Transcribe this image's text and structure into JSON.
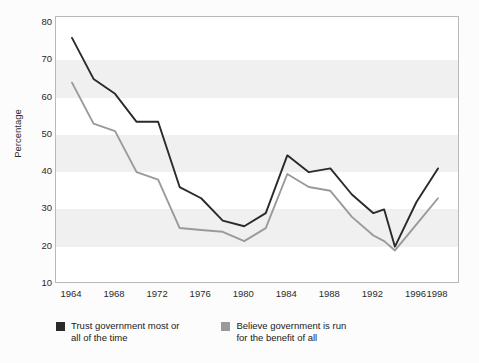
{
  "chart_data": {
    "type": "line",
    "title": "",
    "xlabel": "",
    "ylabel": "Percentage",
    "xlim": [
      1964,
      1998
    ],
    "ylim": [
      10,
      80
    ],
    "grid": "horizontal-bands",
    "legend_position": "below-plot",
    "x": [
      1964,
      1966,
      1968,
      1970,
      1972,
      1974,
      1976,
      1978,
      1980,
      1982,
      1984,
      1986,
      1988,
      1990,
      1992,
      1993,
      1994,
      1996,
      1998
    ],
    "y_ticks": [
      80,
      70,
      60,
      50,
      40,
      30,
      20,
      10
    ],
    "x_ticks": [
      1964,
      1968,
      1972,
      1976,
      1980,
      1984,
      1988,
      1992,
      1996,
      1998
    ],
    "series": [
      {
        "name": "Trust government most or all of the time",
        "color": "#2a2a2a",
        "values": [
          76,
          65,
          61,
          53.5,
          53.5,
          36,
          33,
          27,
          25.5,
          29,
          44.5,
          40,
          41,
          34,
          29,
          30,
          20,
          32,
          41
        ]
      },
      {
        "name": "Believe government is run for the benefit of all",
        "color": "#9a9a9a",
        "values": [
          64,
          53,
          51,
          40,
          38,
          25,
          24.5,
          24,
          21.5,
          25,
          39.5,
          36,
          35,
          28,
          23,
          21.5,
          19,
          26,
          33
        ]
      }
    ]
  },
  "axes": {
    "y_title": "Percentage",
    "y_tick_labels": [
      "80",
      "70",
      "60",
      "50",
      "40",
      "30",
      "20",
      "10"
    ],
    "x_tick_labels": [
      "1964",
      "1968",
      "1972",
      "1976",
      "1980",
      "1984",
      "1988",
      "1992",
      "1996",
      "1998"
    ]
  },
  "legend": {
    "entries": [
      {
        "line1": "Trust government most or",
        "line2": "all of the time",
        "color": "#2a2a2a"
      },
      {
        "line1": "Believe government is run",
        "line2": "for the benefit of all",
        "color": "#9a9a9a"
      }
    ]
  }
}
